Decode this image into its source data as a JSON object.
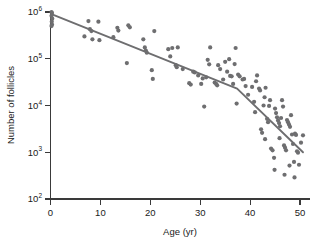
{
  "chart_data": {
    "type": "scatter",
    "title": "",
    "subtitle": "",
    "xlabel": "Age (yr)",
    "ylabel": "Number of follicles",
    "xlim": [
      0,
      52
    ],
    "ylim": [
      100,
      1000000
    ],
    "yscale": "log",
    "xscale": "linear",
    "grid": false,
    "legend": null,
    "legend_position": "none",
    "xticks": [
      0,
      10,
      20,
      30,
      40,
      50
    ],
    "xtick_labels": [
      "0",
      "10",
      "20",
      "30",
      "40",
      "50"
    ],
    "yticks": [
      100,
      1000,
      10000,
      100000,
      1000000
    ],
    "ytick_labels": [
      "10²",
      "10³",
      "10⁴",
      "10⁵",
      "10⁶"
    ],
    "ytick_mantissa": [
      "10",
      "10",
      "10",
      "10",
      "10"
    ],
    "ytick_exponent": [
      "2",
      "3",
      "4",
      "5",
      "6"
    ],
    "point_color": "#6e6e70",
    "line_color": "#6e6e70",
    "axis_color": "#3a3a3a",
    "background_color": "#ffffff",
    "point_radius": 2.1,
    "annotations": [],
    "series": [
      {
        "name": "follicle counts",
        "marker": "circle",
        "points": [
          [
            0.2,
            1000000
          ],
          [
            0.3,
            950000
          ],
          [
            0.2,
            830000
          ],
          [
            0.35,
            720000
          ],
          [
            0.25,
            620000
          ],
          [
            0.3,
            540000
          ],
          [
            0.2,
            500000
          ],
          [
            6.8,
            300000
          ],
          [
            7.6,
            640000
          ],
          [
            7.9,
            430000
          ],
          [
            8.2,
            390000
          ],
          [
            8.4,
            260000
          ],
          [
            9.6,
            620000
          ],
          [
            9.8,
            250000
          ],
          [
            12.6,
            290000
          ],
          [
            13.4,
            460000
          ],
          [
            13.6,
            400000
          ],
          [
            15.3,
            81000
          ],
          [
            15.6,
            520000
          ],
          [
            15.9,
            470000
          ],
          [
            18.6,
            260000
          ],
          [
            18.9,
            175000
          ],
          [
            19.1,
            150000
          ],
          [
            19.3,
            135000
          ],
          [
            20.3,
            57000
          ],
          [
            20.5,
            37000
          ],
          [
            20.8,
            390000
          ],
          [
            23.6,
            160000
          ],
          [
            24.0,
            112000
          ],
          [
            24.4,
            170000
          ],
          [
            25.1,
            73000
          ],
          [
            25.3,
            66000
          ],
          [
            25.5,
            175000
          ],
          [
            27.8,
            30000
          ],
          [
            28.1,
            28000
          ],
          [
            28.6,
            53000
          ],
          [
            28.9,
            51000
          ],
          [
            30.2,
            29000
          ],
          [
            30.5,
            38000
          ],
          [
            30.8,
            9500
          ],
          [
            31.2,
            40000
          ],
          [
            31.5,
            95000
          ],
          [
            31.8,
            76000
          ],
          [
            32.0,
            175000
          ],
          [
            32.9,
            31000
          ],
          [
            33.2,
            29000
          ],
          [
            33.4,
            27000
          ],
          [
            33.6,
            73000
          ],
          [
            34.0,
            60000
          ],
          [
            34.6,
            36000
          ],
          [
            35.4,
            53000
          ],
          [
            35.8,
            98000
          ],
          [
            36.0,
            43000
          ],
          [
            36.3,
            42000
          ],
          [
            36.6,
            29000
          ],
          [
            36.9,
            77000
          ],
          [
            37.1,
            170000
          ],
          [
            37.3,
            11000
          ],
          [
            37.6,
            46000
          ],
          [
            37.9,
            42000
          ],
          [
            38.5,
            36000
          ],
          [
            38.8,
            37000
          ],
          [
            39.1,
            26000
          ],
          [
            40.4,
            25000
          ],
          [
            40.8,
            12000
          ],
          [
            41.0,
            7200
          ],
          [
            41.4,
            44000
          ],
          [
            41.8,
            23000
          ],
          [
            42.0,
            21000
          ],
          [
            42.4,
            2600
          ],
          [
            42.7,
            10000
          ],
          [
            42.9,
            15000
          ],
          [
            43.1,
            24000
          ],
          [
            43.4,
            5200
          ],
          [
            43.6,
            4400
          ],
          [
            43.8,
            9800
          ],
          [
            44.0,
            13000
          ],
          [
            44.2,
            1200
          ],
          [
            44.5,
            1100
          ],
          [
            44.8,
            760
          ],
          [
            45.0,
            8600
          ],
          [
            45.2,
            6900
          ],
          [
            45.4,
            5600
          ],
          [
            45.6,
            4800
          ],
          [
            45.8,
            4200
          ],
          [
            46.0,
            3600
          ],
          [
            46.2,
            5400
          ],
          [
            46.4,
            13000
          ],
          [
            46.6,
            9500
          ],
          [
            46.8,
            1400
          ],
          [
            47.0,
            1250
          ],
          [
            47.2,
            1100
          ],
          [
            47.4,
            4900
          ],
          [
            47.6,
            4400
          ],
          [
            47.8,
            3900
          ],
          [
            48.0,
            3500
          ],
          [
            48.2,
            6200
          ],
          [
            48.4,
            2400
          ],
          [
            48.6,
            1500
          ],
          [
            48.8,
            620
          ],
          [
            49.0,
            2500
          ],
          [
            49.2,
            2350
          ],
          [
            49.4,
            1050
          ],
          [
            49.6,
            980
          ],
          [
            49.8,
            540
          ],
          [
            50.2,
            1600
          ],
          [
            50.6,
            2300
          ],
          [
            44.9,
            420
          ],
          [
            46.9,
            330
          ],
          [
            48.9,
            290
          ],
          [
            47.9,
            520
          ],
          [
            43.0,
            1900
          ],
          [
            45.9,
            2000
          ],
          [
            42.2,
            3100
          ],
          [
            41.2,
            33000
          ],
          [
            39.6,
            17000
          ],
          [
            35.0,
            86000
          ],
          [
            29.6,
            44000
          ],
          [
            26.5,
            60000
          ]
        ]
      }
    ],
    "trend_line": {
      "name": "piecewise regression",
      "breakpoints": [
        [
          0.2,
          900000
        ],
        [
          37.4,
          23000
        ],
        [
          50.6,
          1000
        ]
      ]
    }
  },
  "axes": {
    "x_axis_label": "Age (yr)",
    "y_axis_label": "Number of follicles"
  }
}
